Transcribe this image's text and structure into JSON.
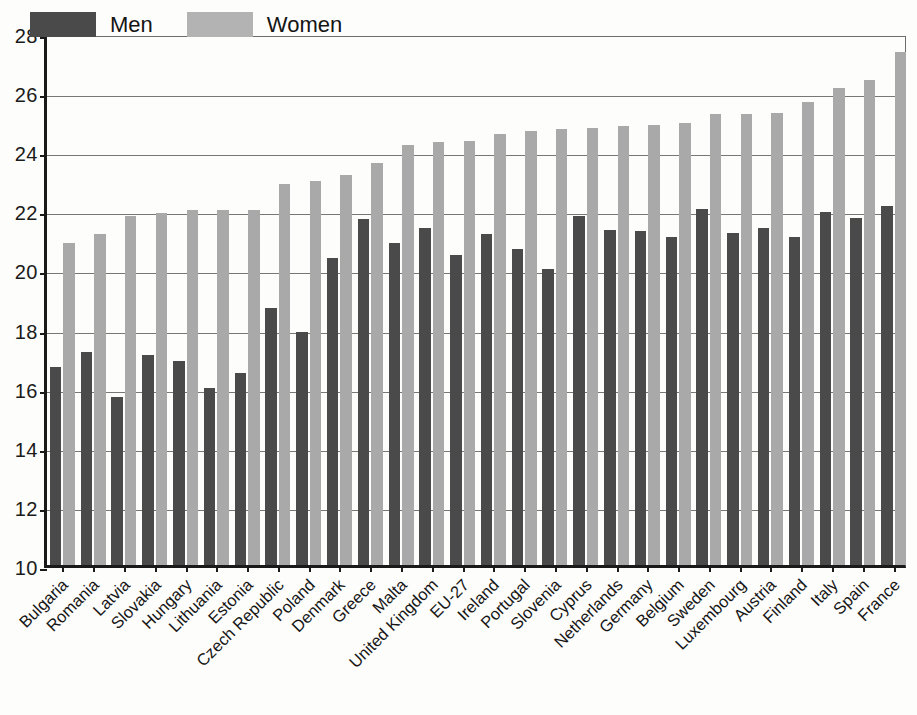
{
  "chart_data": {
    "type": "bar",
    "title": "",
    "subtitle": "",
    "xlabel": "",
    "ylabel": "",
    "ylim": [
      10,
      28
    ],
    "ytick_step": 2,
    "yticks": [
      10,
      12,
      14,
      16,
      18,
      20,
      22,
      24,
      26,
      28
    ],
    "grid": true,
    "legend_position": "top-left",
    "categories": [
      "Bulgaria",
      "Romania",
      "Latvia",
      "Slovakia",
      "Hungary",
      "Lithuania",
      "Estonia",
      "Czech Republic",
      "Poland",
      "Denmark",
      "Greece",
      "Malta",
      "United Kingdom",
      "EU-27",
      "Ireland",
      "Portugal",
      "Slovenia",
      "Cyprus",
      "Netherlands",
      "Germany",
      "Belgium",
      "Sweden",
      "Luxembourg",
      "Austria",
      "Finland",
      "Italy",
      "Spain",
      "France"
    ],
    "series": [
      {
        "name": "Men",
        "color": "#4a4a4a",
        "values": [
          16.7,
          17.2,
          15.7,
          17.1,
          16.9,
          16.0,
          16.5,
          18.7,
          17.9,
          20.4,
          21.7,
          20.9,
          21.4,
          20.5,
          21.2,
          20.7,
          20.0,
          21.8,
          21.35,
          21.3,
          21.1,
          22.05,
          21.25,
          21.4,
          21.1,
          21.95,
          21.75,
          22.15
        ]
      },
      {
        "name": "Women",
        "color": "#a9a9a9",
        "values": [
          20.9,
          21.2,
          21.8,
          21.9,
          22.0,
          22.0,
          22.0,
          22.9,
          23.0,
          23.2,
          23.6,
          24.2,
          24.3,
          24.35,
          24.6,
          24.7,
          24.75,
          24.8,
          24.85,
          24.9,
          24.95,
          25.25,
          25.25,
          25.3,
          25.45,
          25.65,
          26.15,
          26.4
        ]
      }
    ],
    "extra_women_last": 27.35
  },
  "legend": {
    "entries": [
      {
        "label": "Men",
        "swatch": "men"
      },
      {
        "label": "Women",
        "swatch": "women"
      }
    ]
  }
}
